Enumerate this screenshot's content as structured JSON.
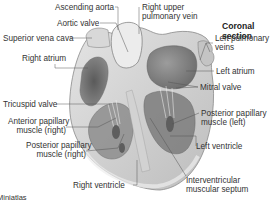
{
  "title": "Coronal section",
  "credit": "Miniatlas",
  "labels": {
    "ascending_aorta": "Ascending aorta",
    "aortic_valve": "Aortic valve",
    "superior_vena_cava": "Superior vena cava",
    "right_atrium": "Right atrium",
    "tricuspid_valve": "Tricuspid valve",
    "anterior_papillary_right_1": "Anterior papillary",
    "anterior_papillary_right_2": "muscle (right)",
    "posterior_papillary_right_1": "Posterior papillary",
    "posterior_papillary_right_2": "muscle (right)",
    "right_ventricle": "Right ventricle",
    "right_upper_pulmonary_vein_1": "Right upper",
    "right_upper_pulmonary_vein_2": "pulmonary vein",
    "left_pulmonary_veins_1": "Left pulmonary",
    "left_pulmonary_veins_2": "veins",
    "left_atrium": "Left atrium",
    "mitral_valve": "Mitral valve",
    "posterior_papillary_left_1": "Posterior papillary",
    "posterior_papillary_left_2": "muscle (left)",
    "left_ventricle": "Left ventricle",
    "interventricular_septum_1": "Interventricular",
    "interventricular_septum_2": "muscular septum"
  },
  "colors": {
    "background": "#ffffff",
    "myocardium": "#c9c9c9",
    "myocardium_light": "#dedede",
    "cavity_dark": "#6e6e6e",
    "cavity_mid": "#9a9a9a",
    "leader_line": "#555555"
  }
}
